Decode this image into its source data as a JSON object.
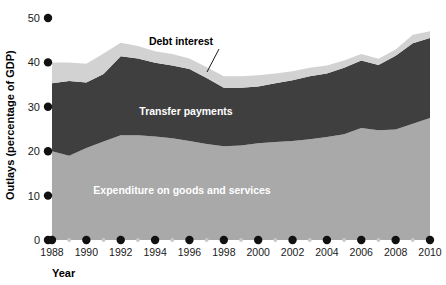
{
  "chart_data": {
    "type": "area",
    "stacked": true,
    "title": "",
    "xlabel": "Year",
    "ylabel": "Outlays (percentage of GDP)",
    "xlim": [
      1988,
      2010
    ],
    "ylim": [
      0,
      50
    ],
    "yticks": [
      0,
      10,
      20,
      30,
      40,
      50
    ],
    "ytick_labels": [
      "0",
      "10",
      "20",
      "30",
      "40",
      "50"
    ],
    "xticks": [
      1988,
      1990,
      1992,
      1994,
      1996,
      1998,
      2000,
      2002,
      2004,
      2006,
      2008,
      2010
    ],
    "xtick_labels": [
      "1988",
      "1990",
      "1992",
      "1994",
      "1996",
      "1998",
      "2000",
      "2002",
      "2004",
      "2006",
      "2008",
      "2010"
    ],
    "minor_xticks": [
      1989,
      1991,
      1993,
      1995,
      1997,
      1999,
      2001,
      2003,
      2005,
      2007,
      2009
    ],
    "grid": false,
    "legend_position": "inline-annotations",
    "x": [
      1988,
      1989,
      1990,
      1991,
      1992,
      1993,
      1994,
      1995,
      1996,
      1997,
      1998,
      1999,
      2000,
      2001,
      2002,
      2003,
      2004,
      2005,
      2006,
      2007,
      2008,
      2009,
      2010
    ],
    "series": [
      {
        "name": "Expenditure on goods and services",
        "color": "#a9a9a9",
        "label_color": "#ffffff",
        "values": [
          20.0,
          19.0,
          20.7,
          22.2,
          23.6,
          23.6,
          23.3,
          22.9,
          22.3,
          21.6,
          21.1,
          21.3,
          21.8,
          22.1,
          22.3,
          22.7,
          23.2,
          23.8,
          25.2,
          24.7,
          24.9,
          26.2,
          27.5
        ]
      },
      {
        "name": "Transfer payments",
        "color": "#3f3f3f",
        "label_color": "#ffffff",
        "values": [
          15.3,
          16.8,
          14.8,
          15.2,
          17.8,
          17.3,
          16.6,
          16.4,
          16.2,
          14.9,
          13.2,
          13.0,
          12.8,
          13.2,
          13.7,
          14.2,
          14.3,
          15.0,
          15.2,
          14.7,
          16.6,
          18.1,
          18.0
        ]
      },
      {
        "name": "Debt interest",
        "color": "#d2d2d2",
        "label_color": "#000000",
        "values": [
          4.7,
          4.2,
          4.2,
          4.6,
          3.0,
          2.8,
          2.6,
          2.6,
          2.4,
          2.4,
          2.6,
          2.6,
          2.5,
          2.2,
          2.0,
          1.9,
          1.8,
          1.6,
          1.5,
          1.4,
          1.4,
          1.9,
          1.5
        ]
      }
    ],
    "annotations": [
      {
        "name": "debt-interest",
        "text": "Debt interest",
        "text_x": 181,
        "text_y": 45,
        "leader_from_x": 219,
        "leader_from_y": 49,
        "leader_to_x": 207,
        "leader_to_y": 72
      },
      {
        "name": "transfer-payments",
        "text": "Transfer payments",
        "text_x": 186,
        "text_y": 115
      },
      {
        "name": "expenditure-goods-services",
        "text": "Expenditure on goods and services",
        "text_x": 182,
        "text_y": 194
      }
    ]
  },
  "axes": {
    "y_title": "Outlays (percentage of GDP)",
    "x_title": "Year",
    "tick_marker_color": "#111111",
    "minor_tick_marker_color": "#c8c8c8"
  }
}
